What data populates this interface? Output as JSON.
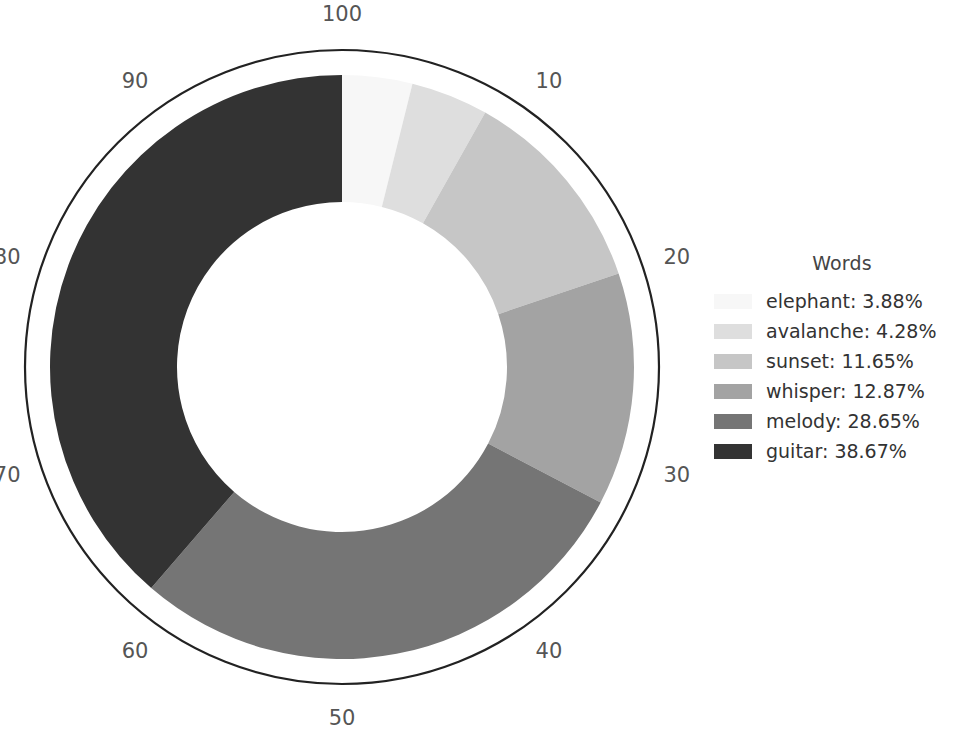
{
  "chart_data": {
    "type": "pie",
    "title": "",
    "variant": "donut",
    "legend_title": "Words",
    "legend_position": "right",
    "grid": false,
    "start_angle_deg": 0,
    "direction": "clockwise",
    "labels": [
      "elephant",
      "avalanche",
      "sunset",
      "whisper",
      "melody",
      "guitar"
    ],
    "values": [
      3.88,
      4.28,
      11.65,
      12.87,
      28.65,
      38.67
    ],
    "value_unit": "%",
    "colors": [
      "#f7f7f7",
      "#dedede",
      "#c6c6c6",
      "#a3a3a3",
      "#757575",
      "#333333"
    ],
    "legend_entries": [
      "elephant: 3.88%",
      "avalanche: 4.28%",
      "sunset: 11.65%",
      "whisper: 12.87%",
      "melody: 28.65%",
      "guitar: 38.67%"
    ],
    "axis": {
      "type": "circular-percent-scale",
      "tick_labels": [
        "10",
        "20",
        "30",
        "40",
        "50",
        "60",
        "70",
        "80",
        "90",
        "100"
      ],
      "tick_values": [
        10,
        20,
        30,
        40,
        50,
        60,
        70,
        80,
        90,
        100
      ],
      "range": [
        0,
        100
      ],
      "ring_outline": true,
      "ring_color": "#222222"
    },
    "geometry": {
      "center_x": 342,
      "center_y": 367,
      "outer_radius": 292,
      "inner_radius": 165,
      "ring_radius": 317,
      "tick_label_radius": 352
    }
  },
  "legend": {
    "title": "Words",
    "items": [
      {
        "label": "elephant: 3.88%",
        "color": "#f7f7f7"
      },
      {
        "label": "avalanche: 4.28%",
        "color": "#dedede"
      },
      {
        "label": "sunset: 11.65%",
        "color": "#c6c6c6"
      },
      {
        "label": "whisper: 12.87%",
        "color": "#a3a3a3"
      },
      {
        "label": "melody: 28.65%",
        "color": "#757575"
      },
      {
        "label": "guitar: 38.67%",
        "color": "#333333"
      }
    ]
  }
}
